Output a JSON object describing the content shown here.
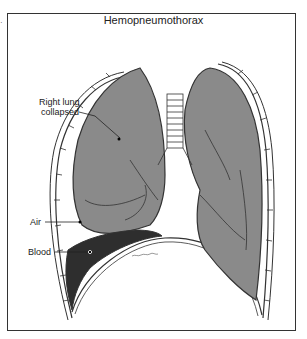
{
  "diagram": {
    "title": "Hemopneumothorax",
    "labels": {
      "right_lung_line1": "Right lung",
      "right_lung_line2": "collapsed",
      "air": "Air",
      "blood": "Blood"
    },
    "signature": "artist signature",
    "colors": {
      "lung_fill": "#8a8a8a",
      "blood_fill": "#2e2e2e",
      "outline": "#333333",
      "background": "#ffffff"
    }
  }
}
